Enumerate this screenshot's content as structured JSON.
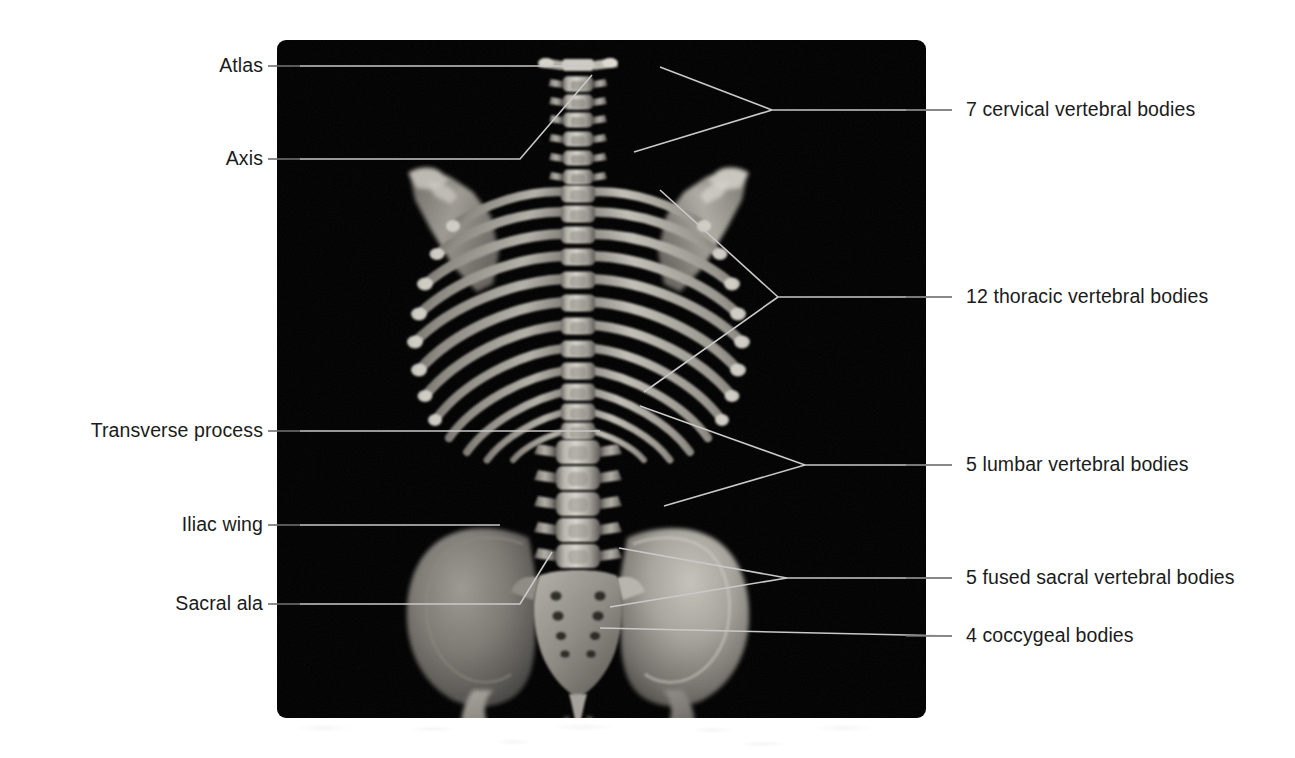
{
  "figure": {
    "panel": {
      "background_color": "#000000",
      "x": 277,
      "y": 40,
      "width": 649,
      "height": 678,
      "corner_radius": 9
    },
    "leader_color": "#c9c9c9",
    "label_color": "#1b1b1b"
  },
  "labels_left": [
    {
      "id": "atlas",
      "text": "Atlas",
      "text_x": 263,
      "text_y": 66,
      "dash_from_x": 268,
      "dash_to_x": 300,
      "dash_y": 66
    },
    {
      "id": "axis",
      "text": "Axis",
      "text_x": 263,
      "text_y": 159,
      "dash_from_x": 268,
      "dash_to_x": 300,
      "dash_y": 159
    },
    {
      "id": "transverse-process",
      "text": "Transverse process",
      "text_x": 263,
      "text_y": 431,
      "dash_from_x": 268,
      "dash_to_x": 300,
      "dash_y": 431
    },
    {
      "id": "iliac-wing",
      "text": "Iliac wing",
      "text_x": 263,
      "text_y": 525,
      "dash_from_x": 268,
      "dash_to_x": 300,
      "dash_y": 525
    },
    {
      "id": "sacral-ala",
      "text": "Sacral ala",
      "text_x": 263,
      "text_y": 604,
      "dash_from_x": 268,
      "dash_to_x": 300,
      "dash_y": 604
    }
  ],
  "labels_right": [
    {
      "id": "cervical",
      "text": "7 cervical vertebral bodies",
      "text_x": 966,
      "text_y": 110,
      "dash_from_x": 906,
      "dash_to_x": 952,
      "dash_y": 110
    },
    {
      "id": "thoracic",
      "text": "12 thoracic vertebral bodies",
      "text_x": 966,
      "text_y": 297,
      "dash_from_x": 906,
      "dash_to_x": 952,
      "dash_y": 297
    },
    {
      "id": "lumbar",
      "text": "5 lumbar vertebral bodies",
      "text_x": 966,
      "text_y": 465,
      "dash_from_x": 906,
      "dash_to_x": 952,
      "dash_y": 465
    },
    {
      "id": "sacral",
      "text": "5 fused sacral vertebral bodies",
      "text_x": 966,
      "text_y": 578,
      "dash_from_x": 906,
      "dash_to_x": 952,
      "dash_y": 578
    },
    {
      "id": "coccygeal",
      "text": "4 coccygeal bodies",
      "text_x": 966,
      "text_y": 636,
      "dash_from_x": 906,
      "dash_to_x": 952,
      "dash_y": 636
    }
  ],
  "anatomy_regions": [
    {
      "name": "atlas",
      "vertebra_count": 1,
      "note": "C1, first cervical vertebra"
    },
    {
      "name": "axis",
      "vertebra_count": 1,
      "note": "C2, second cervical vertebra"
    },
    {
      "name": "cervical vertebrae",
      "vertebra_count": 7
    },
    {
      "name": "thoracic vertebrae",
      "vertebra_count": 12
    },
    {
      "name": "lumbar vertebrae",
      "vertebra_count": 5
    },
    {
      "name": "sacral vertebrae",
      "vertebra_count": 5,
      "note": "fused"
    },
    {
      "name": "coccygeal bodies",
      "vertebra_count": 4
    },
    {
      "name": "transverse process"
    },
    {
      "name": "iliac wing"
    },
    {
      "name": "sacral ala"
    }
  ]
}
